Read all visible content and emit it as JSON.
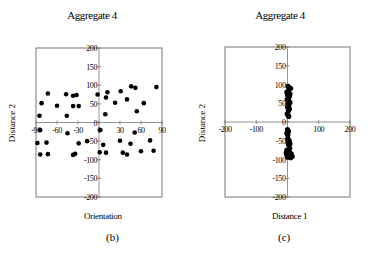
{
  "chart_data": [
    {
      "type": "scatter",
      "panel": "(b)",
      "title": "Aggregate 4",
      "xlabel": "Orientation",
      "ylabel": "Distance 2",
      "xlim": [
        -90,
        90
      ],
      "ylim": [
        -200,
        200
      ],
      "xticks": [
        -90,
        -60,
        -30,
        0,
        30,
        60,
        90
      ],
      "yticks": [
        200,
        150,
        100,
        50,
        0,
        -50,
        -100,
        -150,
        -200
      ],
      "grid": false,
      "legend": null,
      "points": [
        [
          -82,
          52
        ],
        [
          -73,
          78
        ],
        [
          -85,
          18
        ],
        [
          -60,
          45
        ],
        [
          -47,
          76
        ],
        [
          -46,
          18
        ],
        [
          -37,
          72
        ],
        [
          -32,
          74
        ],
        [
          -37,
          44
        ],
        [
          -29,
          44
        ],
        [
          -2,
          75
        ],
        [
          12,
          81
        ],
        [
          10,
          67
        ],
        [
          9,
          22
        ],
        [
          23,
          53
        ],
        [
          31,
          84
        ],
        [
          40,
          62
        ],
        [
          46,
          97
        ],
        [
          52,
          93
        ],
        [
          54,
          30
        ],
        [
          64,
          52
        ],
        [
          82,
          95
        ],
        [
          -84,
          -20
        ],
        [
          -88,
          -55
        ],
        [
          -75,
          -54
        ],
        [
          -84,
          -86
        ],
        [
          -73,
          -85
        ],
        [
          -45,
          -29
        ],
        [
          -29,
          -56
        ],
        [
          -37,
          -87
        ],
        [
          -34,
          -84
        ],
        [
          -17,
          -50
        ],
        [
          2,
          -20
        ],
        [
          6,
          -60
        ],
        [
          1,
          -80
        ],
        [
          10,
          -81
        ],
        [
          30,
          -49
        ],
        [
          34,
          -81
        ],
        [
          40,
          -86
        ],
        [
          45,
          -57
        ],
        [
          51,
          -27
        ],
        [
          60,
          -77
        ],
        [
          73,
          -48
        ],
        [
          78,
          -76
        ]
      ]
    },
    {
      "type": "scatter",
      "panel": "(c)",
      "title": "Aggregate 4",
      "xlabel": "Distance 1",
      "ylabel": "Distance 2",
      "xlim": [
        -200,
        200
      ],
      "ylim": [
        -200,
        200
      ],
      "xticks": [
        -200,
        -100,
        0,
        100,
        200
      ],
      "yticks": [
        200,
        150,
        100,
        50,
        0,
        -50,
        -100,
        -150,
        -200
      ],
      "grid": false,
      "legend": null,
      "points": [
        [
          2,
          95
        ],
        [
          10,
          90
        ],
        [
          5,
          88
        ],
        [
          -2,
          80
        ],
        [
          4,
          78
        ],
        [
          8,
          75
        ],
        [
          0,
          72
        ],
        [
          6,
          68
        ],
        [
          3,
          65
        ],
        [
          -1,
          60
        ],
        [
          5,
          55
        ],
        [
          8,
          52
        ],
        [
          2,
          48
        ],
        [
          4,
          45
        ],
        [
          0,
          40
        ],
        [
          6,
          35
        ],
        [
          3,
          30
        ],
        [
          -1,
          22
        ],
        [
          2,
          18
        ],
        [
          4,
          15
        ],
        [
          0,
          -20
        ],
        [
          3,
          -25
        ],
        [
          -2,
          -30
        ],
        [
          1,
          -35
        ],
        [
          4,
          -48
        ],
        [
          6,
          -52
        ],
        [
          2,
          -55
        ],
        [
          8,
          -58
        ],
        [
          -2,
          -75
        ],
        [
          0,
          -80
        ],
        [
          4,
          -82
        ],
        [
          8,
          -84
        ],
        [
          -3,
          -86
        ],
        [
          2,
          -88
        ],
        [
          6,
          -90
        ],
        [
          12,
          -85
        ],
        [
          15,
          -92
        ],
        [
          10,
          -95
        ],
        [
          0,
          -93
        ],
        [
          5,
          -78
        ],
        [
          -4,
          -82
        ],
        [
          3,
          -60
        ],
        [
          7,
          -70
        ],
        [
          1,
          -45
        ]
      ]
    }
  ],
  "panels": {
    "b": {
      "title": "Aggregate 4",
      "xlabel": "Orientation",
      "ylabel": "Distance 2",
      "caption": "(b)"
    },
    "c": {
      "title": "Aggregate 4",
      "xlabel": "Distance 1",
      "ylabel": "Distance 2",
      "caption": "(c)"
    }
  },
  "colors": {
    "frame": "#777777",
    "marker": "#000000",
    "background": "#ffffff"
  }
}
